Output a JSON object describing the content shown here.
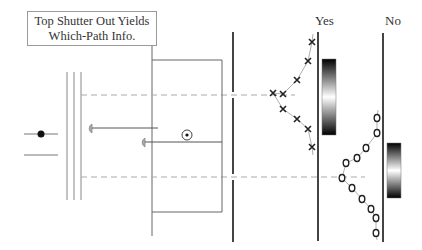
{
  "caption": {
    "line1": "Top Shutter Out Yields",
    "line2": "Which-Path Info."
  },
  "screens": {
    "yes": {
      "label": "Yes",
      "pattern": "which-path (no interference)",
      "marker": "x"
    },
    "no": {
      "label": "No",
      "pattern": "interference",
      "marker": "o"
    }
  },
  "colors": {
    "line": "#555555",
    "dashed": "#aaaaaa",
    "curve": "#999999",
    "shutter": "#999999"
  },
  "x_marks": [
    [
      312,
      42
    ],
    [
      308,
      61
    ],
    [
      297,
      80
    ],
    [
      283,
      94
    ],
    [
      273,
      93
    ],
    [
      283,
      109
    ],
    [
      297,
      119
    ],
    [
      308,
      129
    ],
    [
      312,
      147
    ]
  ],
  "o_marks": [
    [
      377,
      118
    ],
    [
      377,
      133
    ],
    [
      366,
      148
    ],
    [
      357,
      158
    ],
    [
      346,
      163
    ],
    [
      342,
      178
    ],
    [
      352,
      188
    ],
    [
      362,
      199
    ],
    [
      371,
      209
    ],
    [
      376,
      218
    ],
    [
      376,
      233
    ]
  ]
}
